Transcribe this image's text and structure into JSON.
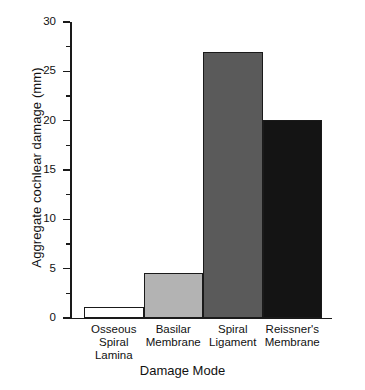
{
  "chart_data": {
    "type": "bar",
    "title": "",
    "xlabel": "Damage Mode",
    "ylabel": "Aggregate cochlear damage (mm)",
    "categories": [
      "Osseous\nSpiral\nLamina",
      "Basilar\nMembrane",
      "Spiral\nLigament",
      "Reissner's\nMembrane"
    ],
    "values": [
      1.1,
      4.6,
      27.0,
      20.1
    ],
    "bar_colors": [
      "#ffffff",
      "#b3b3b3",
      "#5a5a5a",
      "#141414"
    ],
    "bar_edge_color": "#1a1a1a",
    "ylim": [
      0,
      30
    ],
    "xlim_note": "categorical, bars adjacent with no gaps",
    "yticks": [
      0,
      5,
      10,
      15,
      20,
      25,
      30
    ],
    "ytick_labels": [
      "0",
      "5",
      "10",
      "15",
      "20",
      "25",
      "30"
    ],
    "yminor_ticks": [
      2.5,
      7.5,
      12.5,
      17.5,
      22.5,
      27.5
    ],
    "grid": false,
    "legend": "none",
    "units": "mm"
  }
}
